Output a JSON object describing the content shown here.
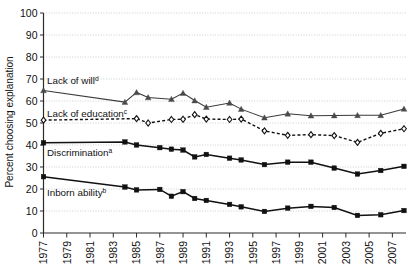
{
  "chart_data": {
    "type": "line",
    "title": "",
    "xlabel": "",
    "ylabel": "Percent choosing explanation",
    "ylim": [
      0,
      100
    ],
    "ytick_values": [
      0,
      10,
      20,
      30,
      40,
      50,
      60,
      70,
      80,
      90,
      100
    ],
    "ytick_labels": [
      "0",
      "10",
      "20",
      "30",
      "40",
      "50",
      "60",
      "70",
      "80",
      "90",
      "100"
    ],
    "xlim": [
      1977,
      2008
    ],
    "xtick_values": [
      1977,
      1979,
      1981,
      1983,
      1985,
      1987,
      1989,
      1991,
      1993,
      1995,
      1997,
      1999,
      2001,
      2003,
      2005,
      2007
    ],
    "xtick_labels": [
      "1977",
      "1979",
      "1981",
      "1983",
      "1985",
      "1987",
      "1989",
      "1991",
      "1993",
      "1995",
      "1997",
      "1999",
      "2001",
      "2003",
      "2005",
      "2007"
    ],
    "grid": true,
    "grid_axis": "y",
    "legend_position": "inline-labels",
    "series": [
      {
        "name": "Lack of will",
        "footnote": "d",
        "label": "Lack of will",
        "marker": "triangle",
        "line_style": "solid",
        "x": [
          1977,
          1984,
          1985,
          1986,
          1988,
          1989,
          1990,
          1991,
          1993,
          1994,
          1996,
          1998,
          2000,
          2002,
          2004,
          2006,
          2008
        ],
        "values": [
          64.8,
          59.5,
          63.9,
          61.6,
          60.8,
          63.6,
          60.2,
          57.2,
          59.1,
          56.3,
          52.4,
          54.2,
          53.3,
          53.4,
          53.5,
          53.5,
          56.4
        ]
      },
      {
        "name": "Lack of education",
        "footnote": "c",
        "label": "Lack of education",
        "marker": "diamond",
        "line_style": "dashed",
        "x": [
          1977,
          1985,
          1986,
          1988,
          1989,
          1990,
          1991,
          1993,
          1994,
          1996,
          1998,
          2000,
          2002,
          2004,
          2006,
          2008
        ],
        "values": [
          51.3,
          52.0,
          50.0,
          51.6,
          51.7,
          53.8,
          51.8,
          51.6,
          51.8,
          46.4,
          44.4,
          44.7,
          44.3,
          41.2,
          45.3,
          47.4
        ]
      },
      {
        "name": "Discrimination",
        "footnote": "a",
        "label": "Discrimination",
        "marker": "square",
        "line_style": "solid-thick",
        "x": [
          1977,
          1984,
          1985,
          1987,
          1988,
          1989,
          1990,
          1991,
          1993,
          1994,
          1996,
          1998,
          2000,
          2002,
          2004,
          2006,
          2008
        ],
        "values": [
          41.0,
          41.4,
          40.0,
          38.8,
          38.1,
          37.7,
          34.6,
          35.7,
          34.0,
          33.2,
          31.1,
          32.2,
          32.2,
          29.5,
          26.8,
          28.4,
          30.3
        ]
      },
      {
        "name": "Inborn ability",
        "footnote": "b",
        "label": "Inborn ability",
        "marker": "square",
        "line_style": "solid-thick",
        "x": [
          1977,
          1984,
          1985,
          1987,
          1988,
          1989,
          1990,
          1991,
          1993,
          1994,
          1996,
          1998,
          2000,
          2002,
          2004,
          2006,
          2008
        ],
        "values": [
          25.6,
          20.9,
          19.6,
          19.8,
          16.7,
          18.8,
          15.7,
          14.8,
          13.0,
          11.9,
          9.8,
          11.3,
          12.1,
          11.6,
          8.0,
          8.3,
          10.2
        ]
      }
    ]
  },
  "axes": {
    "ylabel": "Percent choosing explanation"
  },
  "labels": {
    "lack_of_will": "Lack of will",
    "lack_of_will_sup": "d",
    "lack_of_education": "Lack of education",
    "lack_of_education_sup": "c",
    "discrimination": "Discrimination",
    "discrimination_sup": "a",
    "inborn_ability": "Inborn ability",
    "inborn_ability_sup": "b"
  },
  "colors": {
    "axis": "#2b2b2b",
    "grid": "#b9b9b9",
    "line_will": "#3a3a3a",
    "line_education": "#111111",
    "line_discrimination": "#111111",
    "line_inborn": "#111111",
    "text": "#111111",
    "background": "#ffffff"
  }
}
